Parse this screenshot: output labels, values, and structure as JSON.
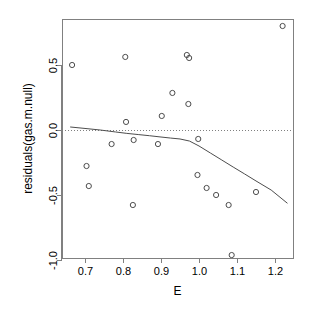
{
  "chart_data": {
    "type": "scatter",
    "title": "",
    "xlabel": "E",
    "ylabel": "residuals(gas.m.null)",
    "xlim": [
      0.662,
      1.232
    ],
    "ylim": [
      -1.075,
      0.845
    ],
    "grid": false,
    "legend": null,
    "xticks": [
      0.7,
      0.8,
      0.9,
      1.0,
      1.1,
      1.2
    ],
    "xtick_labels": [
      "0.7",
      "0.8",
      "0.9",
      "1.0",
      "1.1",
      "1.2"
    ],
    "yticks": [
      0.5,
      0.0,
      -0.5,
      -1.0
    ],
    "ytick_labels": [
      "0.5",
      "0.0",
      "-0.5",
      "-1.0"
    ],
    "marker": "open-circle",
    "marker_color": "#4d4d4d",
    "line_color": "#4d4d4d",
    "reference_line": {
      "y": 0.0,
      "style": "dotted",
      "color": "#808080"
    },
    "points": [
      {
        "x": 0.666,
        "y": 0.5
      },
      {
        "x": 0.704,
        "y": -0.277
      },
      {
        "x": 0.71,
        "y": -0.431
      },
      {
        "x": 0.77,
        "y": -0.108
      },
      {
        "x": 0.806,
        "y": 0.562
      },
      {
        "x": 0.808,
        "y": 0.062
      },
      {
        "x": 0.826,
        "y": -0.577
      },
      {
        "x": 0.828,
        "y": -0.077
      },
      {
        "x": 0.892,
        "y": -0.108
      },
      {
        "x": 0.902,
        "y": 0.108
      },
      {
        "x": 0.93,
        "y": 0.285
      },
      {
        "x": 0.968,
        "y": 0.577
      },
      {
        "x": 0.974,
        "y": 0.554
      },
      {
        "x": 0.972,
        "y": 0.2
      },
      {
        "x": 0.998,
        "y": -0.069
      },
      {
        "x": 0.996,
        "y": -0.346
      },
      {
        "x": 1.02,
        "y": -0.446
      },
      {
        "x": 1.045,
        "y": -0.5
      },
      {
        "x": 1.078,
        "y": -0.577
      },
      {
        "x": 1.086,
        "y": -0.962
      },
      {
        "x": 1.15,
        "y": -0.477
      },
      {
        "x": 1.22,
        "y": 0.8
      }
    ],
    "smoother": {
      "name": "lowess",
      "x": [
        0.662,
        0.7,
        0.74,
        0.78,
        0.81,
        0.84,
        0.87,
        0.9,
        0.925,
        0.95,
        0.975,
        1.0,
        1.03,
        1.06,
        1.09,
        1.12,
        1.15,
        1.19,
        1.232
      ],
      "y": [
        0.023,
        0.012,
        0.0,
        -0.015,
        -0.026,
        -0.035,
        -0.044,
        -0.054,
        -0.062,
        -0.069,
        -0.085,
        -0.123,
        -0.177,
        -0.231,
        -0.285,
        -0.338,
        -0.392,
        -0.462,
        -0.562
      ]
    }
  },
  "geometry": {
    "plot_box": {
      "left": 62,
      "top": 19,
      "right": 293,
      "bottom": 258
    },
    "x_pixel": {
      "v1": 0.7,
      "p1": 85,
      "v2": 1.2,
      "p2": 275
    },
    "y_pixel": {
      "v1": 0.0,
      "p1": 130,
      "v2": 0.5,
      "p2": 65
    }
  }
}
